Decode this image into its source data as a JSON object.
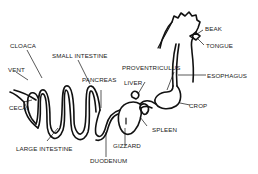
{
  "diagram": {
    "labels": {
      "beak": "BEAK",
      "tongue": "TONGUE",
      "esophagus": "ESOPHAGUS",
      "crop": "CROP",
      "proventriculus": "PROVENTRICULUS",
      "liver": "LIVER",
      "spleen": "SPLEEN",
      "gizzard": "GIZZARD",
      "duodenum": "DUODENUM",
      "pancreas": "PANCREAS",
      "small_intestine": "SMALL INTESTINE",
      "cloaca": "CLOACA",
      "vent": "VENT",
      "ceca": "CECA",
      "large_intestine": "LARGE INTESTINE"
    },
    "colors": {
      "line": "#111111",
      "background": "#ffffff"
    }
  }
}
